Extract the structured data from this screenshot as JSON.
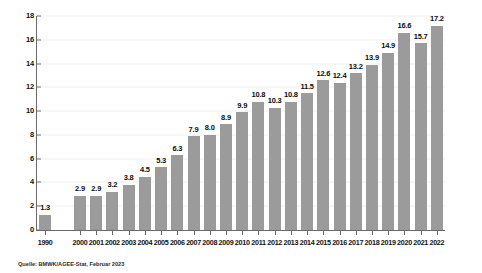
{
  "chart_data": {
    "type": "bar",
    "title": "",
    "subtitle": "",
    "xlabel": "",
    "ylabel": "",
    "ylim": [
      0,
      18
    ],
    "ytick_step": 2,
    "yticks": [
      "0",
      "2",
      "4",
      "6",
      "8",
      "10",
      "12",
      "14",
      "16",
      "18"
    ],
    "grid": true,
    "legend": null,
    "bar_color": "#9b9b9b",
    "categories": [
      "1990",
      "2000",
      "2001",
      "2002",
      "2003",
      "2004",
      "2005",
      "2006",
      "2007",
      "2008",
      "2009",
      "2010",
      "2011",
      "2012",
      "2013",
      "2014",
      "2015",
      "2016",
      "2017",
      "2018",
      "2019",
      "2020",
      "2021",
      "2022"
    ],
    "values": [
      1.3,
      2.9,
      2.9,
      3.2,
      3.8,
      4.5,
      5.3,
      6.3,
      7.9,
      8.0,
      8.9,
      9.9,
      10.8,
      10.3,
      10.8,
      11.5,
      12.6,
      12.4,
      13.2,
      13.9,
      14.9,
      16.6,
      15.7,
      17.2
    ],
    "value_labels": [
      "1.3",
      "2.9",
      "2.9",
      "3.2",
      "3.8",
      "4.5",
      "5.3",
      "6.3",
      "7.9",
      "8.0",
      "8.9",
      "9.9",
      "10.8",
      "10.3",
      "10.8",
      "11.5",
      "12.6",
      "12.4",
      "13.2",
      "13.9",
      "14.9",
      "16.6",
      "15.7",
      "17.2"
    ],
    "gap_after_index": 0,
    "annotations": []
  },
  "footer": {
    "source": "Quelle: BMWK/AGEE-Stat, Februar 2023"
  }
}
